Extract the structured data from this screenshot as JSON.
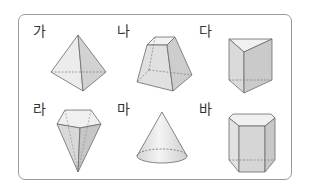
{
  "figure": {
    "items": [
      {
        "label": "가",
        "shape": "triangular-pyramid"
      },
      {
        "label": "나",
        "shape": "square-frustum"
      },
      {
        "label": "다",
        "shape": "triangular-prism"
      },
      {
        "label": "라",
        "shape": "pentagonal-pyramid-inverted"
      },
      {
        "label": "마",
        "shape": "cone"
      },
      {
        "label": "바",
        "shape": "pentagonal-prism"
      }
    ]
  },
  "colors": {
    "border": "#9a9a9a",
    "edge": "#6a6a6a",
    "face_light": "#ececec",
    "face_mid": "#d6d6d6",
    "face_dark": "#c4c4c4"
  }
}
